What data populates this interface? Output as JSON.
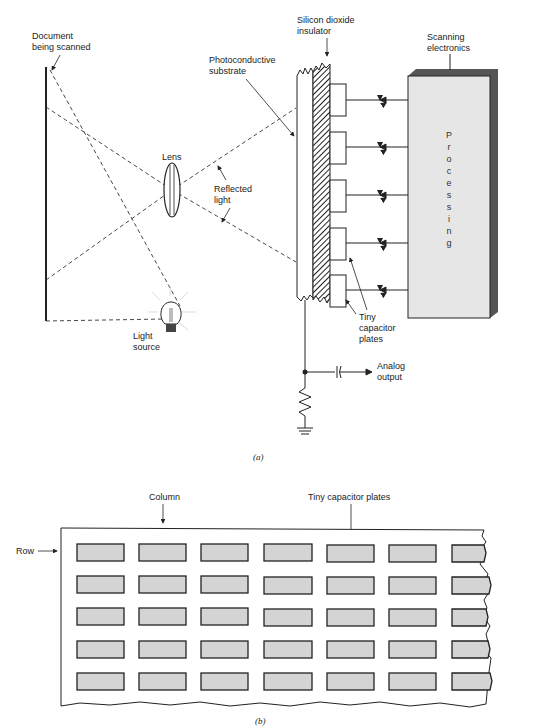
{
  "figure_a": {
    "caption": "(a)",
    "labels": {
      "document": [
        "Document",
        "being scanned"
      ],
      "photoconductive": [
        "Photoconductive",
        "substrate"
      ],
      "silicon": [
        "Silicon dioxide",
        "insulator"
      ],
      "scanning": [
        "Scanning",
        "electronics"
      ],
      "lens": "Lens",
      "reflected": [
        "Reflected",
        "light"
      ],
      "light_source": [
        "Light",
        "source"
      ],
      "tiny_plates": [
        "Tiny",
        "capacitor",
        "plates"
      ],
      "analog": [
        "Analog",
        "output"
      ]
    },
    "processing_letters": [
      "P",
      "r",
      "o",
      "c",
      "e",
      "s",
      "s",
      "i",
      "n",
      "g"
    ],
    "colors": {
      "processing_fill": "#e6e6e6",
      "processing_shadow": "#555555",
      "line": "#222222"
    }
  },
  "figure_b": {
    "caption": "(b)",
    "labels": {
      "column": "Column",
      "row": "Row",
      "tiny_plates": "Tiny capacitor plates"
    },
    "grid": {
      "rows": 5,
      "columns": 7
    },
    "colors": {
      "plate_fill": "#d4d4d4",
      "plate_stroke": "#222222"
    }
  }
}
